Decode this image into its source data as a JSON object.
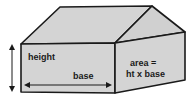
{
  "diagram": {
    "type": "3d-box-house",
    "labels": {
      "height": "height",
      "base": "base",
      "area_line1": "area =",
      "area_line2": "ht x base"
    },
    "colors": {
      "face_fill": "#d4d4d4",
      "stroke": "#1a1a1a",
      "background": "#ffffff"
    }
  }
}
